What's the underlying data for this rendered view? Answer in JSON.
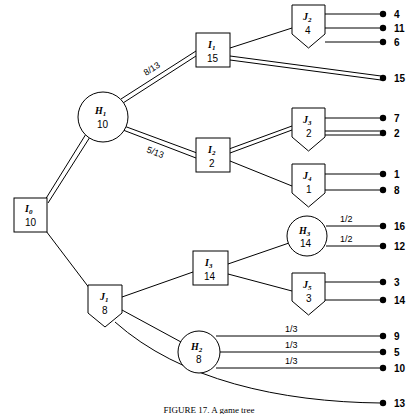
{
  "figure": {
    "type": "decision-tree-diagram",
    "caption": "FIGURE 17. A game tree",
    "width": 418,
    "height": 414,
    "background_color": "#ffffff",
    "line_color": "#000000"
  },
  "nodes": [
    {
      "id": "I0",
      "letter": "I",
      "subscript": "0",
      "value": "10",
      "shape": "square",
      "x": 30,
      "y": 215
    },
    {
      "id": "H1",
      "letter": "H",
      "subscript": "1",
      "value": "10",
      "shape": "circle",
      "x": 103,
      "y": 117
    },
    {
      "id": "I1",
      "letter": "I",
      "subscript": "1",
      "value": "15",
      "shape": "square",
      "x": 213,
      "y": 50
    },
    {
      "id": "J2",
      "letter": "J",
      "subscript": "2",
      "value": "4",
      "shape": "pentagon",
      "x": 308,
      "y": 22
    },
    {
      "id": "I2",
      "letter": "I",
      "subscript": "2",
      "value": "2",
      "shape": "square",
      "x": 213,
      "y": 155
    },
    {
      "id": "J3",
      "letter": "J",
      "subscript": "3",
      "value": "2",
      "shape": "pentagon",
      "x": 308,
      "y": 125
    },
    {
      "id": "J4",
      "letter": "J",
      "subscript": "4",
      "value": "1",
      "shape": "pentagon",
      "x": 308,
      "y": 181
    },
    {
      "id": "J1",
      "letter": "J",
      "subscript": "1",
      "value": "8",
      "shape": "pentagon",
      "x": 105,
      "y": 302
    },
    {
      "id": "I3",
      "letter": "I",
      "subscript": "3",
      "value": "14",
      "shape": "square",
      "x": 210,
      "y": 268
    },
    {
      "id": "H3",
      "letter": "H",
      "subscript": "3",
      "value": "14",
      "shape": "circle",
      "x": 307,
      "y": 236
    },
    {
      "id": "J5",
      "letter": "J",
      "subscript": "5",
      "value": "3",
      "shape": "pentagon",
      "x": 308,
      "y": 290
    },
    {
      "id": "H2",
      "letter": "H",
      "subscript": "2",
      "value": "8",
      "shape": "circle",
      "x": 199,
      "y": 352
    }
  ],
  "terminals": [
    {
      "id": "t4",
      "payoff": "4",
      "x": 383,
      "y": 14
    },
    {
      "id": "t11",
      "payoff": "11",
      "x": 383,
      "y": 28
    },
    {
      "id": "t6",
      "payoff": "6",
      "x": 383,
      "y": 42
    },
    {
      "id": "t15",
      "payoff": "15",
      "x": 383,
      "y": 78
    },
    {
      "id": "t7",
      "payoff": "7",
      "x": 383,
      "y": 118
    },
    {
      "id": "t2",
      "payoff": "2",
      "x": 383,
      "y": 133
    },
    {
      "id": "t1",
      "payoff": "1",
      "x": 383,
      "y": 174
    },
    {
      "id": "t8",
      "payoff": "8",
      "x": 383,
      "y": 190
    },
    {
      "id": "t16",
      "payoff": "16",
      "x": 383,
      "y": 226
    },
    {
      "id": "t12",
      "payoff": "12",
      "x": 383,
      "y": 246
    },
    {
      "id": "t3",
      "payoff": "3",
      "x": 383,
      "y": 282
    },
    {
      "id": "t14",
      "payoff": "14",
      "x": 383,
      "y": 300
    },
    {
      "id": "t9",
      "payoff": "9",
      "x": 383,
      "y": 336
    },
    {
      "id": "t5",
      "payoff": "5",
      "x": 383,
      "y": 352
    },
    {
      "id": "t10",
      "payoff": "10",
      "x": 383,
      "y": 368
    },
    {
      "id": "t13",
      "payoff": "13",
      "x": 383,
      "y": 403
    }
  ],
  "edges": [
    {
      "from": "I0",
      "to": "H1",
      "style": "double",
      "label": ""
    },
    {
      "from": "I0",
      "to": "J1",
      "style": "single",
      "label": ""
    },
    {
      "from": "H1",
      "to": "I1",
      "style": "double",
      "label": "8/13",
      "label_x": 155,
      "label_y": 68
    },
    {
      "from": "H1",
      "to": "I2",
      "style": "double",
      "label": "5/13",
      "label_x": 155,
      "label_y": 141
    },
    {
      "from": "I1",
      "to": "J2",
      "style": "single",
      "label": ""
    },
    {
      "from": "I1",
      "to": "t15",
      "style": "double",
      "label": ""
    },
    {
      "from": "J2",
      "to": "t4",
      "style": "single",
      "label": ""
    },
    {
      "from": "J2",
      "to": "t11",
      "style": "single",
      "label": ""
    },
    {
      "from": "J2",
      "to": "t6",
      "style": "single",
      "label": ""
    },
    {
      "from": "I2",
      "to": "J3",
      "style": "double",
      "label": ""
    },
    {
      "from": "I2",
      "to": "J4",
      "style": "single",
      "label": ""
    },
    {
      "from": "J3",
      "to": "t7",
      "style": "single",
      "label": ""
    },
    {
      "from": "J3",
      "to": "t2",
      "style": "double",
      "label": ""
    },
    {
      "from": "J4",
      "to": "t1",
      "style": "single",
      "label": ""
    },
    {
      "from": "J4",
      "to": "t8",
      "style": "single",
      "label": ""
    },
    {
      "from": "J1",
      "to": "I3",
      "style": "single",
      "label": ""
    },
    {
      "from": "J1",
      "to": "H2",
      "style": "single",
      "label": ""
    },
    {
      "from": "J1",
      "to": "t13",
      "style": "curve",
      "label": ""
    },
    {
      "from": "I3",
      "to": "H3",
      "style": "single",
      "label": ""
    },
    {
      "from": "I3",
      "to": "J5",
      "style": "single",
      "label": ""
    },
    {
      "from": "H3",
      "to": "t16",
      "style": "single",
      "label": "1/2",
      "label_x": 348,
      "label_y": 220
    },
    {
      "from": "H3",
      "to": "t12",
      "style": "single",
      "label": "1/2",
      "label_x": 348,
      "label_y": 240
    },
    {
      "from": "J5",
      "to": "t3",
      "style": "single",
      "label": ""
    },
    {
      "from": "J5",
      "to": "t14",
      "style": "single",
      "label": ""
    },
    {
      "from": "H2",
      "to": "t9",
      "style": "single",
      "label": "1/3",
      "label_x": 293,
      "label_y": 330
    },
    {
      "from": "H2",
      "to": "t5",
      "style": "single",
      "label": "1/3",
      "label_x": 293,
      "label_y": 346
    },
    {
      "from": "H2",
      "to": "t10",
      "style": "single",
      "label": "1/3",
      "label_x": 293,
      "label_y": 362
    }
  ]
}
